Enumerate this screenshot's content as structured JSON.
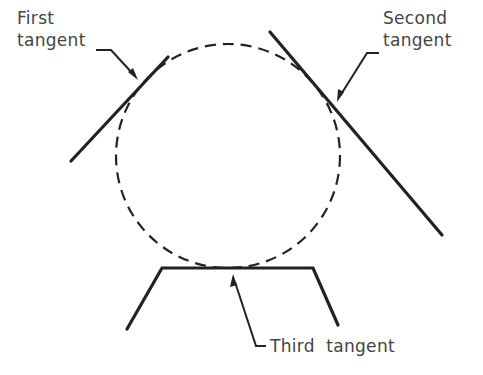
{
  "diagram": {
    "colors": {
      "background": "#ffffff",
      "stroke": "#222222",
      "text": "#444444"
    },
    "circle": {
      "cx": 228,
      "cy": 156,
      "r": 112,
      "style": "dashed"
    },
    "labels": {
      "first": {
        "line1": "First",
        "line2": "tangent"
      },
      "second": {
        "line1": "Second",
        "line2": "tangent"
      },
      "third": {
        "line1": "Third  tangent"
      }
    }
  }
}
